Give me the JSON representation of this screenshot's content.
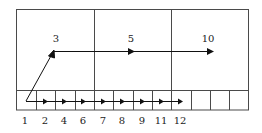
{
  "diagram": {
    "colors": {
      "line": "#4a4a4a",
      "arrow": "#111111",
      "background": "#ffffff"
    },
    "upper_labels": [
      {
        "text": "3",
        "x": 56,
        "y": 42
      },
      {
        "text": "5",
        "x": 131,
        "y": 42
      },
      {
        "text": "10",
        "x": 208,
        "y": 42
      }
    ],
    "bottom_labels": [
      {
        "text": "1",
        "x": 25
      },
      {
        "text": "2",
        "x": 45
      },
      {
        "text": "4",
        "x": 64
      },
      {
        "text": "6",
        "x": 83
      },
      {
        "text": "7",
        "x": 103
      },
      {
        "text": "8",
        "x": 122
      },
      {
        "text": "9",
        "x": 142
      },
      {
        "text": "11",
        "x": 161
      },
      {
        "text": "12",
        "x": 180
      }
    ],
    "top_columns": 3,
    "bottom_cells": 12,
    "small_arrowheads_x": [
      45,
      64,
      83,
      103,
      122,
      142,
      161,
      180
    ],
    "large_arrowheads_x": [
      132,
      211
    ]
  }
}
